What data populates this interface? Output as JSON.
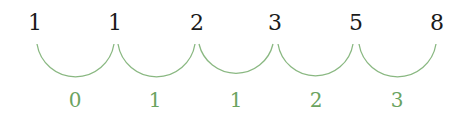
{
  "diagram": {
    "sequence": [
      "1",
      "1",
      "2",
      "3",
      "5",
      "8"
    ],
    "differences": [
      "0",
      "1",
      "1",
      "2",
      "3"
    ],
    "colors": {
      "sequence": "#1a1a1a",
      "differences": "#6aa35f",
      "arcs": "#8ab882"
    }
  }
}
